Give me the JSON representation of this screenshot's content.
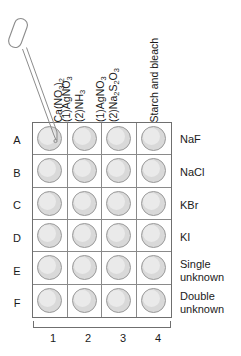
{
  "figure": {
    "plate": {
      "rows": 6,
      "columns": 4,
      "well_fill_color": "#d9d9d9",
      "well_border_color": "#9a9a9a",
      "plate_border_color": "#6f6f6f",
      "grid_line_color": "#8a8a8a"
    },
    "dropper": {
      "name": "dropper-pipette",
      "tip_target": "A1",
      "outline_color": "#8a8a8a"
    },
    "column_headers": [
      {
        "id": "col-1",
        "lines": [
          {
            "pre": "Ca(NO",
            "sub": "3",
            "mid": ")",
            "sub2": "2",
            "post": ""
          }
        ],
        "text": "Ca(NO3)2"
      },
      {
        "id": "col-2",
        "lines": [
          {
            "text": "(1)AgNO",
            "sub": "3"
          },
          {
            "text": "(2)NH",
            "sub": "3"
          }
        ],
        "text": "(1)AgNO3 (2)NH3"
      },
      {
        "id": "col-3",
        "lines": [
          {
            "text": "(1)AgNO",
            "sub": "3"
          },
          {
            "text": "(2)Na2S2O3",
            "sub": "3"
          }
        ],
        "text": "(1)AgNO3 (2)Na2S2O3"
      },
      {
        "id": "col-4",
        "lines": [
          {
            "text": "Starch and bleach"
          }
        ],
        "text": "Starch and bleach"
      }
    ],
    "row_letters": [
      "A",
      "B",
      "C",
      "D",
      "E",
      "F"
    ],
    "row_labels": [
      {
        "line1": "NaF",
        "line2": ""
      },
      {
        "line1": "NaCl",
        "line2": ""
      },
      {
        "line1": "KBr",
        "line2": ""
      },
      {
        "line1": "KI",
        "line2": ""
      },
      {
        "line1": "Single",
        "line2": "unknown"
      },
      {
        "line1": "Double",
        "line2": "unknown"
      }
    ],
    "column_numbers": [
      "1",
      "2",
      "3",
      "4"
    ]
  }
}
